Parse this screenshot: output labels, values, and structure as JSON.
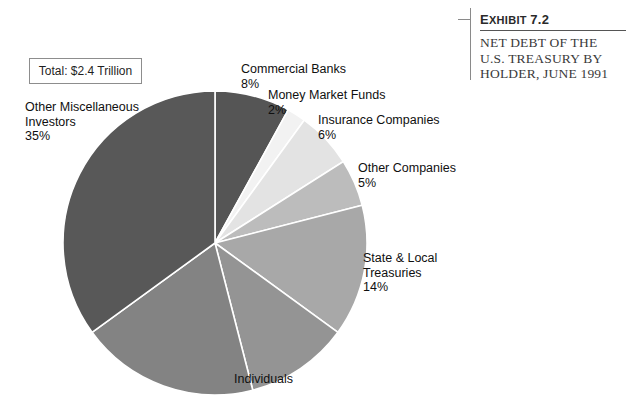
{
  "exhibit": {
    "number_prefix": "E",
    "number_rest": "XHIBIT",
    "number_label": "Exhibit 7.2",
    "number_value": "7.2",
    "title_line1": "NET DEBT OF THE",
    "title_line2": "U.S. TREASURY BY",
    "title_line3": "HOLDER, JUNE 1991"
  },
  "total_box": {
    "label": "Total:  $2.4 Trillion"
  },
  "labels": {
    "misc_name": "Other Miscellaneous",
    "misc_name2": "Investors",
    "misc_pct": "35%",
    "banks_name": "Commercial Banks",
    "banks_pct": "8%",
    "mmf_name": "Money Market Funds",
    "mmf_pct": "2%",
    "insurance_name": "Insurance Companies",
    "insurance_pct": "6%",
    "othco_name": "Other Companies",
    "othco_pct": "5%",
    "state_name": "State & Local",
    "state_name2": "Treasuries",
    "state_pct": "14%",
    "individuals_name": "Individuals"
  },
  "chart_data": {
    "type": "pie",
    "title": "NET DEBT OF THE U.S. TREASURY BY HOLDER, JUNE 1991",
    "subtitle": "Exhibit 7.2",
    "annotation": "Total:  $2.4 Trillion",
    "total": "$2.4 Trillion",
    "units": "percent of total net debt",
    "legend": "none",
    "start_angle_deg": 0,
    "direction": "clockwise",
    "categories": [
      "Commercial Banks",
      "Money Market Funds",
      "Insurance Companies",
      "Other Companies",
      "State & Local Treasuries",
      "Unlabeled Slice A",
      "Individuals",
      "Other Miscellaneous Investors"
    ],
    "values": [
      8,
      2,
      6,
      5,
      14,
      11,
      19,
      35
    ],
    "labeled": [
      true,
      true,
      true,
      true,
      true,
      false,
      true,
      true
    ],
    "colors": [
      "#555555",
      "#f2f2f2",
      "#e3e3e3",
      "#bcbcbc",
      "#a8a8a8",
      "#949494",
      "#838383",
      "#585858"
    ],
    "slices": [
      {
        "name": "Commercial Banks",
        "value": 8,
        "pct_label": "8%",
        "color": "#555555"
      },
      {
        "name": "Money Market Funds",
        "value": 2,
        "pct_label": "2%",
        "color": "#f2f2f2"
      },
      {
        "name": "Insurance Companies",
        "value": 6,
        "pct_label": "6%",
        "color": "#e3e3e3"
      },
      {
        "name": "Other Companies",
        "value": 5,
        "pct_label": "5%",
        "color": "#bcbcbc"
      },
      {
        "name": "State & Local Treasuries",
        "value": 14,
        "pct_label": "14%",
        "color": "#a8a8a8"
      },
      {
        "name": "Unlabeled Slice A",
        "value": 11,
        "pct_label": "",
        "color": "#949494"
      },
      {
        "name": "Individuals",
        "value": 19,
        "pct_label": "",
        "color": "#838383"
      },
      {
        "name": "Other Miscellaneous Investors",
        "value": 35,
        "pct_label": "35%",
        "color": "#585858"
      }
    ]
  }
}
